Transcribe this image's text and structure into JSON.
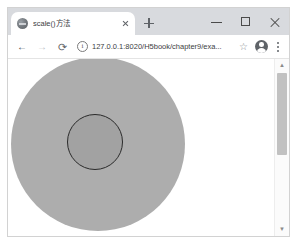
{
  "browser": {
    "tab": {
      "title": "scale()方法",
      "favicon_name": "globe-favicon",
      "close_label": "×"
    },
    "new_tab_label": "+",
    "window_controls": {
      "minimize_label": "—",
      "maximize_label": "□",
      "close_label": "×"
    },
    "toolbar": {
      "back_label": "←",
      "forward_label": "→",
      "reload_label": "⟳",
      "site_info_icon": "info-circle-icon",
      "url": "127.0.0.1:8020/H5book/chapter9/exa...",
      "bookmark_label": "☆",
      "profile_icon": "account-avatar-icon",
      "menu_icon": "three-dot-menu-icon"
    },
    "scrollbar": {
      "up_label": "▲",
      "down_label": "▼"
    }
  },
  "page": {
    "background": "#ffffff",
    "shapes": [
      {
        "name": "outer-circle",
        "fill": "#adadad",
        "stroke": "none",
        "center_x": 90,
        "center_y": 85,
        "radius": 87
      },
      {
        "name": "inner-circle",
        "fill": "#a2a2a2",
        "stroke": "#2b2b2b",
        "stroke_width": 1,
        "center_x": 87,
        "center_y": 83,
        "radius": 28
      }
    ]
  }
}
